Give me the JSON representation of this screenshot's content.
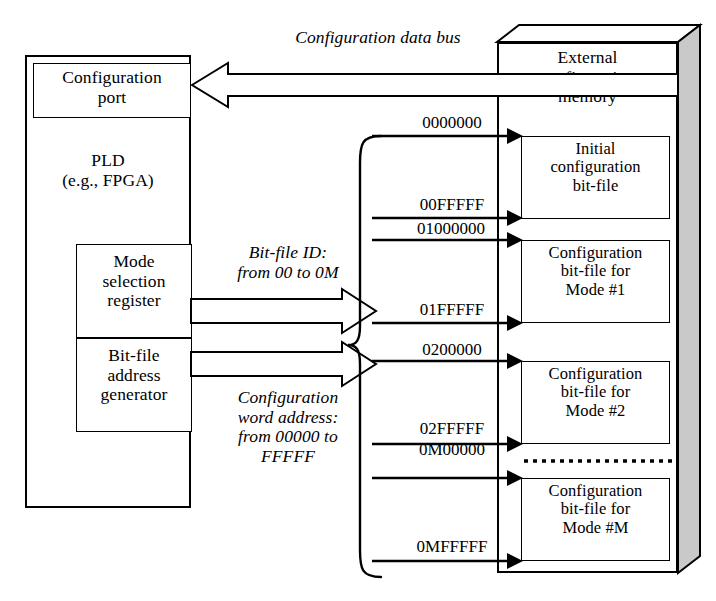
{
  "diagram": {
    "pld": {
      "label": "PLD\n(e.g., FPGA)",
      "config_port": "Configuration\nport",
      "mode_selection_register": "Mode\nselection\nregister",
      "bitfile_address_generator": "Bit-file\naddress\ngenerator"
    },
    "bus_label": "Configuration data bus",
    "annotations": {
      "bitfile_id": "Bit-file ID:\nfrom 00 to 0M",
      "word_address": "Configuration\nword address:\nfrom 00000 to\nFFFFF"
    },
    "memory": {
      "label": "External\nconfiguration\nmemory",
      "blocks": [
        {
          "text": "Initial\nconfiguration\nbit-file",
          "start": "0000000",
          "end": "00FFFFF"
        },
        {
          "text": "Configuration\nbit-file for\nMode #1",
          "start": "01000000",
          "end": "01FFFFF"
        },
        {
          "text": "Configuration\nbit-file for\nMode #2",
          "start": "0200000",
          "end": "02FFFFF"
        },
        {
          "text": "Configuration\nbit-file for\nMode #M",
          "start": "0M00000",
          "end": "0MFFFFF"
        }
      ]
    },
    "colors": {
      "stroke": "#000000",
      "fill": "#ffffff",
      "shade": "#c9c9c9"
    }
  }
}
